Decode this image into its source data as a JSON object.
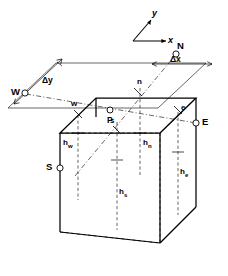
{
  "figure": {
    "kind": "control-volume-3d",
    "background_color": "#ffffff",
    "line_color": "#000000"
  },
  "axes": {
    "x_label": "x",
    "y_label": "y"
  },
  "compass_nodes": [
    {
      "id": "N",
      "label": "N",
      "marker": "open-circle"
    },
    {
      "id": "S",
      "label": "S",
      "marker": "open-circle"
    },
    {
      "id": "E",
      "label": "E",
      "marker": "open-circle"
    },
    {
      "id": "W",
      "label": "W",
      "marker": "open-circle"
    }
  ],
  "center_node": {
    "id": "P",
    "label": "P",
    "marker": "open-circle"
  },
  "face_labels": [
    {
      "id": "n",
      "label": "n"
    },
    {
      "id": "s",
      "label": "s"
    },
    {
      "id": "e",
      "label": "e"
    },
    {
      "id": "w",
      "label": "w"
    }
  ],
  "dimensions": [
    {
      "id": "dx",
      "label": "Δx"
    },
    {
      "id": "dy",
      "label": "Δy"
    }
  ],
  "distances": [
    {
      "id": "h_n",
      "base": "h",
      "sub": "n"
    },
    {
      "id": "h_s",
      "base": "h",
      "sub": "s"
    },
    {
      "id": "h_e",
      "base": "h",
      "sub": "e"
    },
    {
      "id": "h_w",
      "base": "h",
      "sub": "w"
    }
  ]
}
